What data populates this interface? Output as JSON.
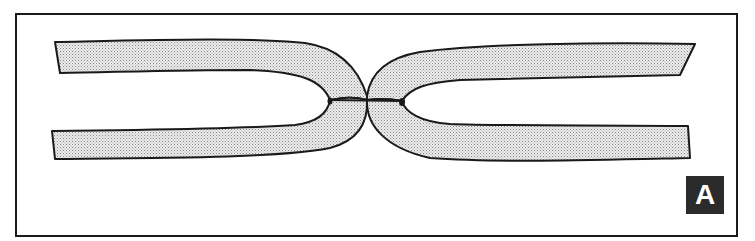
{
  "figure": {
    "label": "A",
    "colors": {
      "outline": "#1a1a1a",
      "fill_dots": "#9a9a9a",
      "fill_bg": "#e9e9e9",
      "label_bg": "#2b2b2b",
      "label_text": "#ffffff"
    }
  }
}
